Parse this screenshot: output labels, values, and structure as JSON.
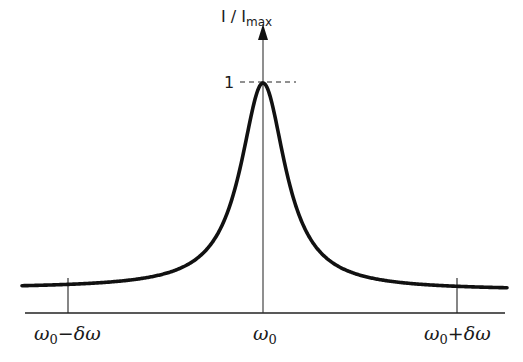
{
  "chart_data": {
    "type": "line",
    "title": "",
    "xlabel": "",
    "ylabel": "I / I_max",
    "ylabel_parts": {
      "main": "I / I",
      "sub": "max"
    },
    "ylim": [
      0,
      1
    ],
    "grid": false,
    "legend": null,
    "x_ticks": [
      {
        "label": "ω0−δω",
        "main": "ω",
        "sub": "0",
        "rest": "−δω",
        "value": -1
      },
      {
        "label": "ω0",
        "main": "ω",
        "sub": "0",
        "rest": "",
        "value": 0
      },
      {
        "label": "ω0+δω",
        "main": "ω",
        "sub": "0",
        "rest": "+δω",
        "value": 1
      }
    ],
    "y_ticks": [
      {
        "label": "1",
        "value": 1
      }
    ],
    "annotations": [
      "dashed line marking I/I_max = 1 at the peak"
    ],
    "series": [
      {
        "name": "Lorentzian line profile",
        "shape": "lorentzian",
        "center": 0,
        "half_width_at_half_max_in_delta_omega_units": 0.14,
        "x": [
          -1.0,
          -0.8,
          -0.6,
          -0.4,
          -0.3,
          -0.2,
          -0.14,
          -0.1,
          -0.05,
          0,
          0.05,
          0.1,
          0.14,
          0.2,
          0.3,
          0.4,
          0.6,
          0.8,
          1.0
        ],
        "values": [
          0.02,
          0.03,
          0.05,
          0.11,
          0.18,
          0.33,
          0.5,
          0.66,
          0.89,
          1.0,
          0.89,
          0.66,
          0.5,
          0.33,
          0.18,
          0.11,
          0.05,
          0.03,
          0.02
        ]
      }
    ]
  }
}
